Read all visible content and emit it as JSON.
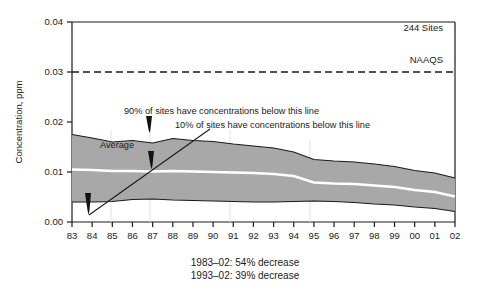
{
  "chart_data": {
    "type": "area",
    "title": "",
    "subtitle": "",
    "xlabel": "",
    "ylabel": "Concentration, ppm",
    "xlim": [
      1983,
      2002
    ],
    "ylim": [
      0.0,
      0.04
    ],
    "yticks": [
      "0.00",
      "0.01",
      "0.02",
      "0.03",
      "0.04"
    ],
    "ytick_values": [
      0.0,
      0.01,
      0.02,
      0.03,
      0.04
    ],
    "grid": false,
    "legend_position": "none",
    "categories": [
      "83",
      "84",
      "85",
      "86",
      "87",
      "88",
      "89",
      "90",
      "91",
      "92",
      "93",
      "94",
      "95",
      "96",
      "97",
      "98",
      "99",
      "00",
      "01",
      "02"
    ],
    "x": [
      1983,
      1984,
      1985,
      1986,
      1987,
      1988,
      1989,
      1990,
      1991,
      1992,
      1993,
      1994,
      1995,
      1996,
      1997,
      1998,
      1999,
      2000,
      2001,
      2002
    ],
    "series": [
      {
        "name": "90th percentile",
        "values": [
          0.0175,
          0.0168,
          0.016,
          0.0163,
          0.0158,
          0.0167,
          0.0163,
          0.0161,
          0.0156,
          0.0152,
          0.0148,
          0.014,
          0.0125,
          0.0122,
          0.012,
          0.0116,
          0.0111,
          0.0103,
          0.0098,
          0.0088
        ]
      },
      {
        "name": "Average",
        "values": [
          0.0105,
          0.0104,
          0.0102,
          0.0102,
          0.0101,
          0.0102,
          0.0101,
          0.01,
          0.0099,
          0.0098,
          0.0096,
          0.0092,
          0.0079,
          0.0077,
          0.0076,
          0.0073,
          0.007,
          0.0064,
          0.006,
          0.0051
        ]
      },
      {
        "name": "10th percentile",
        "values": [
          0.004,
          0.004,
          0.0041,
          0.0045,
          0.0046,
          0.0044,
          0.0043,
          0.0042,
          0.0041,
          0.004,
          0.004,
          0.0041,
          0.0042,
          0.0041,
          0.0039,
          0.0036,
          0.0034,
          0.003,
          0.0027,
          0.0021
        ]
      }
    ],
    "reference_lines": [
      {
        "name": "NAAQS",
        "value": 0.03,
        "style": "dashed",
        "label": "NAAQS"
      }
    ],
    "annotations": [
      {
        "name": "site-count",
        "text": "244 Sites"
      },
      {
        "name": "naaqs-label",
        "text": "NAAQS"
      },
      {
        "name": "p90-annotation",
        "text": "90% of sites have concentrations below this line"
      },
      {
        "name": "p10-annotation",
        "text": "10% of sites have concentrations below this line"
      },
      {
        "name": "average-annotation",
        "text": "Average"
      }
    ],
    "caption_lines": [
      "1983–02: 54% decrease",
      "1993–02: 39% decrease"
    ],
    "colors": {
      "band_fill": "#a8a8a8",
      "band_edge": "#1a1a1a",
      "average_line": "#ffffff",
      "axis": "#1a1a1a",
      "background": "#ffffff"
    }
  }
}
